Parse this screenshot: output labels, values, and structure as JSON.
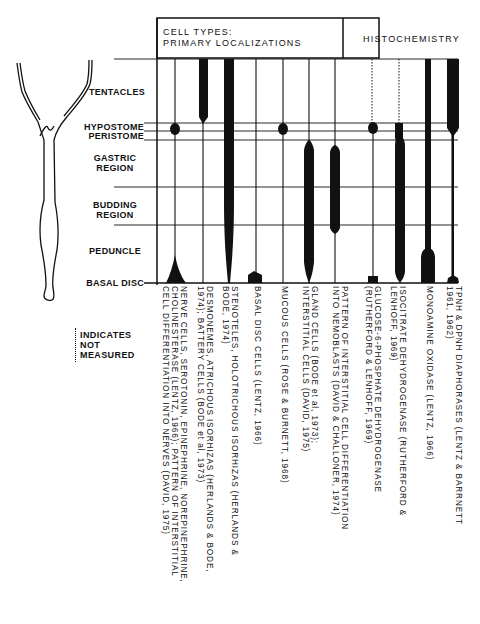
{
  "header": {
    "cell_types_title_line1": "CELL TYPES:",
    "cell_types_title_line2": "PRIMARY LOCALIZATIONS",
    "histochemistry_title": "HISTOCHEMISTRY"
  },
  "body_regions": [
    {
      "label": "TENTACLES"
    },
    {
      "label": "HYPOSTOME"
    },
    {
      "label": "PERISTOME"
    },
    {
      "label": "GASTRIC REGION"
    },
    {
      "label": "BUDDING REGION"
    },
    {
      "label": "PEDUNCLE"
    },
    {
      "label": "BASAL DISC"
    }
  ],
  "legend": {
    "line1": "INDICATES",
    "line2": "NOT",
    "line3": "MEASURED",
    "style": "dotted line"
  },
  "columns": [
    {
      "group": "cell_types",
      "label": "NERVE CELLS, SEROTONIN, EPINEPHRINE, NOREPINEPHRINE,\nCHOLINESTERASE (LENTZ, 1966); PATTERN OF INTERSTITIAL\nCELL DIFFERENTIATION INTO NERVES (DAVID, 1975)"
    },
    {
      "group": "cell_types",
      "label": "DESMONEMES, ATRICHOUS ISORHIZAS (HERLANDS & BODE,\n1974); BATTERY CELLS (BODE et al, 1973)"
    },
    {
      "group": "cell_types",
      "label": "STENOTELES, HOLOTRICHOUS ISORHIZAS (HERLANDS &\nBODE, 1974)"
    },
    {
      "group": "cell_types",
      "label": "BASAL DISC CELLS (LENTZ, 1966)"
    },
    {
      "group": "cell_types",
      "label": "MUCOUS CELLS (ROSE & BURNETT, 1968)"
    },
    {
      "group": "cell_types",
      "label": "GLAND CELLS (BODE et al, 1973);\nINTERSTITIAL CELLS (DAVID, 1975)"
    },
    {
      "group": "cell_types",
      "label": "PATTERN OF INTERSTITIAL CELL DIFFERENTIATION\nINTO NEMOBLASTS (DAVID & CHALLONER, 1974)"
    },
    {
      "group": "histochemistry",
      "label": "GLUCOSE-6-PHOSPHATE DEHYDROGENASE\n(RUTHERFORD & LENHOFF, 1969)"
    },
    {
      "group": "histochemistry",
      "label": "ISOCITRATE DEHYDROGENASE (RUTHERFORD &\nLENHOFF, 1969)"
    },
    {
      "group": "histochemistry",
      "label": "MONOAMINE OXIDASE (LENTZ, 1966)"
    },
    {
      "group": "histochemistry",
      "label": "TPNH & DPNH DIAPHORASES (LENTZ & BARRNETT\n1961, 1962)"
    }
  ]
}
